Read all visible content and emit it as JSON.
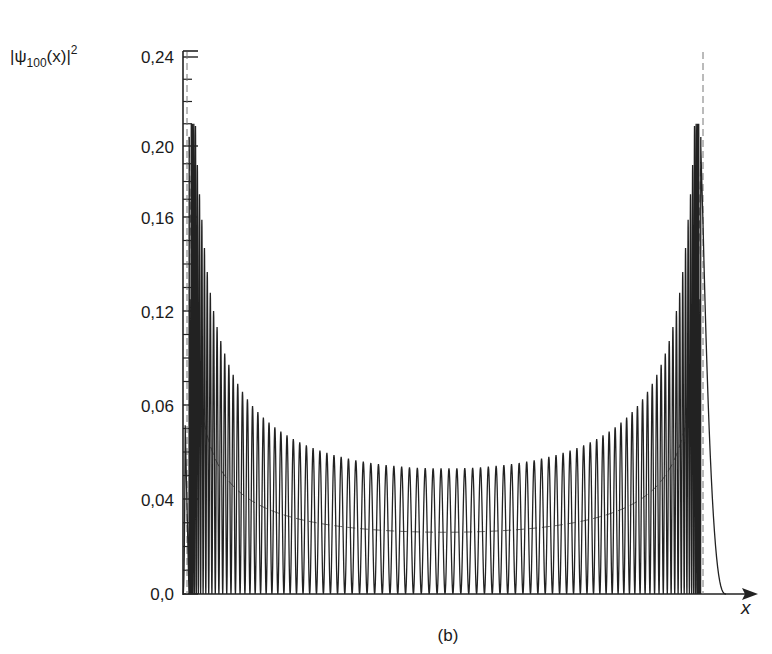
{
  "chart_data": {
    "type": "line",
    "title": "",
    "caption": "(b)",
    "ylabel": {
      "prefix": "|ψ",
      "subscript": "100",
      "middle": "(x)|",
      "superscript": "2"
    },
    "xlabel": "x",
    "y_tick_labels": [
      "0,0",
      "0,04",
      "0,06",
      "0,12",
      "0,16",
      "0,20",
      "0,24"
    ],
    "y_tick_values": [
      0.0,
      0.04,
      0.08,
      0.12,
      0.16,
      0.2,
      0.24
    ],
    "ylim": [
      0.0,
      0.24
    ],
    "grid": false,
    "legend": null,
    "series": [
      {
        "name": "|ψ100(x)|^2 quantum probability density",
        "style": "solid",
        "quantum_number_n": 100,
        "num_peaks": 100,
        "outer_peak_height": 0.204,
        "second_peak_height": 0.125,
        "third_peak_height": 0.102,
        "central_peak_height": 0.053,
        "symmetric": true
      },
      {
        "name": "classical probability density",
        "style": "dashed",
        "minimum_value": 0.026,
        "diverges_at_turning_points": true
      },
      {
        "name": "classical turning points",
        "style": "dashed-vertical",
        "positions": [
          "left",
          "right"
        ]
      }
    ],
    "peak_envelope_samples": {
      "x_fraction": [
        0.02,
        0.05,
        0.08,
        0.11,
        0.14,
        0.18,
        0.22,
        0.27,
        0.32,
        0.38,
        0.44,
        0.5
      ],
      "height": [
        0.204,
        0.125,
        0.102,
        0.09,
        0.081,
        0.074,
        0.069,
        0.064,
        0.06,
        0.057,
        0.054,
        0.053
      ]
    }
  }
}
